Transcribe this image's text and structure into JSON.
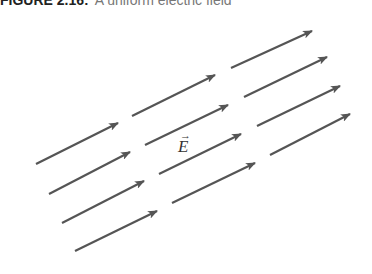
{
  "caption": {
    "number": "FIGURE 2.16:",
    "text": "A uniform electric field"
  },
  "diagram": {
    "label": "E",
    "label_vector_mark": "→",
    "arrow_color": "#555555",
    "arrows": [
      {
        "x1": 36,
        "y1": 164,
        "x2": 118,
        "y2": 123
      },
      {
        "x1": 49,
        "y1": 194,
        "x2": 130,
        "y2": 152
      },
      {
        "x1": 62,
        "y1": 223,
        "x2": 144,
        "y2": 181
      },
      {
        "x1": 75,
        "y1": 251,
        "x2": 157,
        "y2": 211
      },
      {
        "x1": 132,
        "y1": 116,
        "x2": 215,
        "y2": 75
      },
      {
        "x1": 145,
        "y1": 145,
        "x2": 228,
        "y2": 105
      },
      {
        "x1": 159,
        "y1": 174,
        "x2": 241,
        "y2": 134
      },
      {
        "x1": 172,
        "y1": 203,
        "x2": 255,
        "y2": 163
      },
      {
        "x1": 231,
        "y1": 68,
        "x2": 312,
        "y2": 31
      },
      {
        "x1": 244,
        "y1": 97,
        "x2": 327,
        "y2": 57
      },
      {
        "x1": 257,
        "y1": 126,
        "x2": 340,
        "y2": 86
      },
      {
        "x1": 270,
        "y1": 155,
        "x2": 350,
        "y2": 114
      }
    ]
  }
}
